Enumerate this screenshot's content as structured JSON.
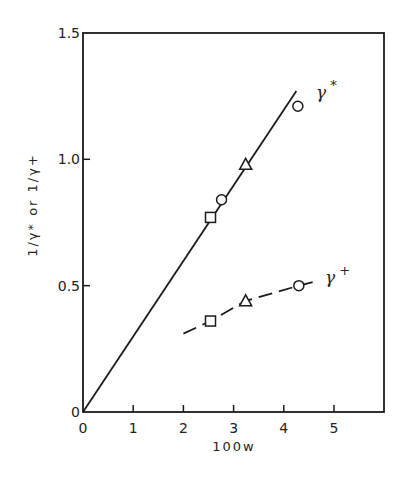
{
  "chart_data": {
    "type": "line",
    "title": "",
    "xlabel": "100w",
    "ylabel": "1/γ* or 1/γ+",
    "xlim": [
      0,
      6
    ],
    "ylim": [
      0,
      1.5
    ],
    "x_ticks": [
      "0",
      "1",
      "2",
      "3",
      "4",
      "5"
    ],
    "y_ticks": [
      "0",
      "0.5",
      "1.0",
      "1.5"
    ],
    "grid": false,
    "legend": "inline labels at line ends",
    "series": [
      {
        "name": "γ*",
        "label_main": "γ",
        "label_sup": "*",
        "line_style": "solid",
        "fit_line": {
          "x": [
            0,
            4.25
          ],
          "y": [
            0,
            1.27
          ]
        },
        "points": [
          {
            "x": 2.54,
            "y": 0.77,
            "marker": "square"
          },
          {
            "x": 2.76,
            "y": 0.84,
            "marker": "circle"
          },
          {
            "x": 3.24,
            "y": 0.98,
            "marker": "triangle"
          },
          {
            "x": 4.28,
            "y": 1.21,
            "marker": "circle"
          }
        ]
      },
      {
        "name": "γ+",
        "label_main": "γ",
        "label_sup": "+",
        "line_style": "dashed",
        "fit_line": {
          "x": [
            2.0,
            2.54,
            3.24,
            4.3,
            4.7
          ],
          "y": [
            0.31,
            0.36,
            0.44,
            0.5,
            0.52
          ]
        },
        "points": [
          {
            "x": 2.54,
            "y": 0.36,
            "marker": "square"
          },
          {
            "x": 3.24,
            "y": 0.44,
            "marker": "triangle"
          },
          {
            "x": 4.3,
            "y": 0.5,
            "marker": "circle"
          }
        ]
      }
    ]
  },
  "labels": {
    "origin_y": "0",
    "origin_x": "0",
    "y_axis_title": "1/γ* or 1/γ+",
    "x_axis_title": "100w"
  }
}
